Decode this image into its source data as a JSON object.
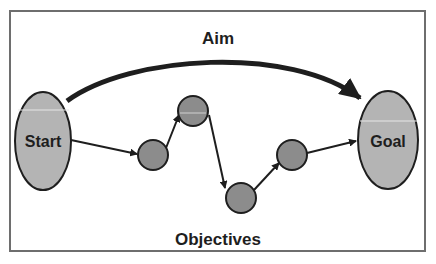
{
  "colors": {
    "background": "#ffffff",
    "frame": "#6e6e6e",
    "stroke": "#1e1e1e",
    "ellipse_fill": "#b4b4b4",
    "node_fill": "#8c8c8c",
    "highlight": "#e6e6e6"
  },
  "labels": {
    "aim": "Aim",
    "objectives": "Objectives",
    "start": "Start",
    "goal": "Goal"
  },
  "nodes": [
    {
      "id": "start",
      "shape": "ellipse",
      "label": "Start"
    },
    {
      "id": "objective-1",
      "shape": "circle"
    },
    {
      "id": "objective-2",
      "shape": "circle"
    },
    {
      "id": "objective-3",
      "shape": "circle"
    },
    {
      "id": "objective-4",
      "shape": "circle"
    },
    {
      "id": "goal",
      "shape": "ellipse",
      "label": "Goal"
    }
  ],
  "edges": [
    {
      "from": "start",
      "to": "goal",
      "label": "Aim",
      "style": "thick-curved"
    },
    {
      "from": "start",
      "to": "objective-1"
    },
    {
      "from": "objective-1",
      "to": "objective-2"
    },
    {
      "from": "objective-2",
      "to": "objective-3"
    },
    {
      "from": "objective-3",
      "to": "objective-4"
    },
    {
      "from": "objective-4",
      "to": "goal"
    }
  ]
}
